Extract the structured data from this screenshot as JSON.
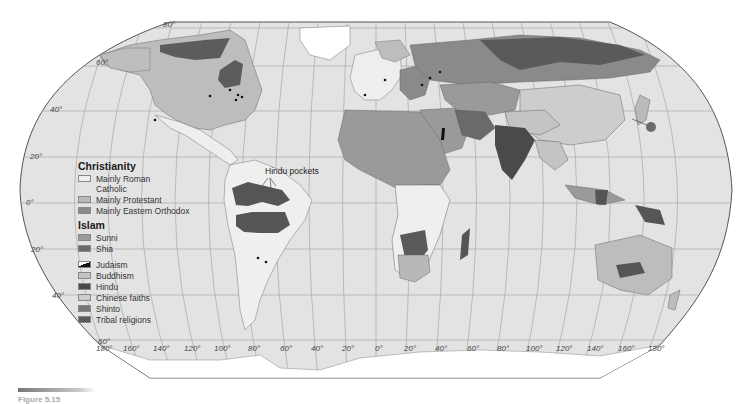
{
  "map": {
    "projection": "Robinson",
    "colors": {
      "ocean": "#e2e2e2",
      "graticule": "#9a9a9a",
      "border": "#555555",
      "roman_catholic": "#efefef",
      "protestant": "#b8b8b8",
      "eastern_orthodox": "#8a8a8a",
      "sunni": "#9a9a9a",
      "shia": "#6a6a6a",
      "buddhism": "#c4c4c4",
      "hindu": "#4a4a4a",
      "chinese_faiths": "#cdcdcd",
      "shinto": "#777777",
      "tribal": "#5a5a5a",
      "ice": "#ffffff"
    },
    "latitude_labels_left": [
      "80°",
      "60°",
      "40°",
      "20°",
      "0°",
      "20°",
      "40°",
      "60°"
    ],
    "longitude_labels_bottom": [
      "180°",
      "160°",
      "140°",
      "120°",
      "100°",
      "80°",
      "60°",
      "40°",
      "20°",
      "0°",
      "20°",
      "40°",
      "60°",
      "80°",
      "100°",
      "120°",
      "140°",
      "160°",
      "180°"
    ],
    "annotation": "Hindu pockets"
  },
  "legend": {
    "christianity": {
      "title": "Christianity",
      "items": [
        {
          "label": "Mainly Roman Catholic",
          "line1": "Mainly Roman",
          "line2": "Catholic"
        },
        {
          "label": "Mainly Protestant"
        },
        {
          "label": "Mainly Eastern Orthodox"
        }
      ]
    },
    "islam": {
      "title": "Islam",
      "items": [
        {
          "label": "Sunni"
        },
        {
          "label": "Shia"
        }
      ]
    },
    "other": [
      {
        "label": "Judaism"
      },
      {
        "label": "Buddhism"
      },
      {
        "label": "Hindu"
      },
      {
        "label": "Chinese faiths"
      },
      {
        "label": "Shinto"
      },
      {
        "label": "Tribal religions"
      }
    ]
  },
  "caption": {
    "text": "Figure 5.15"
  }
}
